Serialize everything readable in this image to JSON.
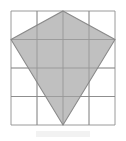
{
  "figure": {
    "name": "grid-with-shaded-kite",
    "canvas": {
      "width": 126,
      "height": 141,
      "background": "#ffffff"
    },
    "grid": {
      "name": "square-grid",
      "rows": 4,
      "columns": 4,
      "x0": 11,
      "y0": 11,
      "x1": 115,
      "y1": 125,
      "cell_width": 26,
      "cell_height": 28.5,
      "line_color": "#8f8f8f",
      "border_color": "#8f8f8f",
      "line_width": 0.9,
      "x_lines": [
        11,
        37,
        63,
        89,
        115
      ],
      "y_lines": [
        11,
        39.5,
        68,
        96.5,
        125
      ]
    },
    "shape": {
      "name": "kite-polygon",
      "type": "polygon",
      "sides": 4,
      "fill_color": "#b5b5b5",
      "fill_opacity": 0.85,
      "stroke_color": "#8a8a8a",
      "stroke_width": 1.1,
      "vertices": [
        {
          "label": "top",
          "x": 63,
          "y": 11,
          "grid_col": 2,
          "grid_row": 0
        },
        {
          "label": "right",
          "x": 115,
          "y": 39.5,
          "grid_col": 4,
          "grid_row": 1
        },
        {
          "label": "bottom",
          "x": 63,
          "y": 125,
          "grid_col": 2,
          "grid_row": 4
        },
        {
          "label": "left",
          "x": 11,
          "y": 39.5,
          "grid_col": 0,
          "grid_row": 1
        }
      ],
      "points_attr": "63,11 115,39.5 63,125 11,39.5"
    },
    "artifact": {
      "name": "scan-smudge",
      "x": 36,
      "y": 131,
      "width": 54,
      "height": 6,
      "color": "#f2f2f2"
    }
  }
}
